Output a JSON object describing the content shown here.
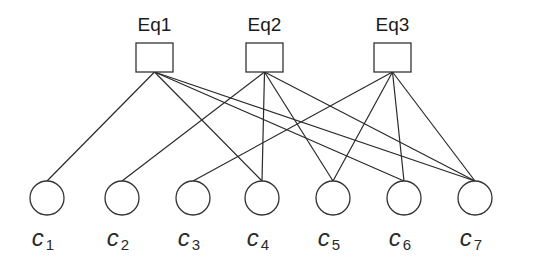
{
  "diagram": {
    "type": "bipartite-graph",
    "check_nodes": [
      {
        "id": "Eq1",
        "label": "Eq1"
      },
      {
        "id": "Eq2",
        "label": "Eq2"
      },
      {
        "id": "Eq3",
        "label": "Eq3"
      }
    ],
    "variable_nodes": [
      {
        "id": "c1",
        "symbol": "c",
        "subscript": "1"
      },
      {
        "id": "c2",
        "symbol": "c",
        "subscript": "2"
      },
      {
        "id": "c3",
        "symbol": "c",
        "subscript": "3"
      },
      {
        "id": "c4",
        "symbol": "c",
        "subscript": "4"
      },
      {
        "id": "c5",
        "symbol": "c",
        "subscript": "5"
      },
      {
        "id": "c6",
        "symbol": "c",
        "subscript": "6"
      },
      {
        "id": "c7",
        "symbol": "c",
        "subscript": "7"
      }
    ],
    "edges": [
      [
        "Eq1",
        "c1"
      ],
      [
        "Eq1",
        "c4"
      ],
      [
        "Eq1",
        "c6"
      ],
      [
        "Eq1",
        "c7"
      ],
      [
        "Eq2",
        "c2"
      ],
      [
        "Eq2",
        "c4"
      ],
      [
        "Eq2",
        "c5"
      ],
      [
        "Eq2",
        "c7"
      ],
      [
        "Eq3",
        "c3"
      ],
      [
        "Eq3",
        "c5"
      ],
      [
        "Eq3",
        "c6"
      ],
      [
        "Eq3",
        "c7"
      ]
    ]
  }
}
